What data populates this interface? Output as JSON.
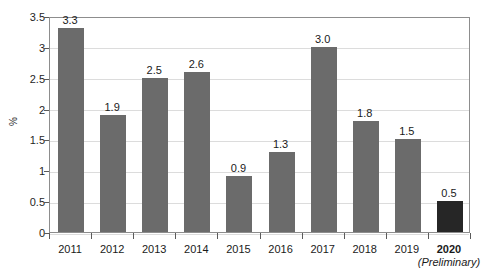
{
  "chart_data": {
    "type": "bar",
    "title": "",
    "subtitle": "",
    "xlabel": "",
    "ylabel": "%",
    "ylim": [
      0,
      3.5
    ],
    "ytick_labels": [
      "3.5",
      "3",
      "2.5",
      "2",
      "1.5",
      "1",
      "0.5",
      "0"
    ],
    "ytick_values": [
      3.5,
      3,
      2.5,
      2,
      1.5,
      1,
      0.5,
      0
    ],
    "grid": true,
    "legend": "none",
    "categories": [
      "2011",
      "2012",
      "2013",
      "2014",
      "2015",
      "2016",
      "2017",
      "2018",
      "2019",
      "2020"
    ],
    "values": [
      3.3,
      1.9,
      2.5,
      2.6,
      0.9,
      1.3,
      3.0,
      1.8,
      1.5,
      0.5
    ],
    "data_labels": [
      "3.3",
      "1.9",
      "2.5",
      "2.6",
      "0.9",
      "1.3",
      "3.0",
      "1.8",
      "1.5",
      "0.5"
    ],
    "annotations": [
      {
        "name": "preliminary-note",
        "text": "(Preliminary)",
        "attached_to": "2020"
      }
    ],
    "series": [
      {
        "name": "annual-percent",
        "values": [
          3.3,
          1.9,
          2.5,
          2.6,
          0.9,
          1.3,
          3.0,
          1.8,
          1.5,
          0.5
        ]
      }
    ],
    "bar_colors": {
      "default": "#6b6b6b",
      "highlight": "#262626",
      "highlight_category": "2020"
    },
    "axis_color": "#8d8d8d",
    "grid_color": "#dcdcdc",
    "text_color": "#1a1a1a"
  },
  "axis": {
    "y_label": "%",
    "ticks": [
      {
        "label": "3.5",
        "value": 3.5
      },
      {
        "label": "3",
        "value": 3
      },
      {
        "label": "2.5",
        "value": 2.5
      },
      {
        "label": "2",
        "value": 2
      },
      {
        "label": "1.5",
        "value": 1.5
      },
      {
        "label": "1",
        "value": 1
      },
      {
        "label": "0.5",
        "value": 0.5
      },
      {
        "label": "0",
        "value": 0
      }
    ]
  },
  "footnote": {
    "preliminary": "(Preliminary)"
  }
}
